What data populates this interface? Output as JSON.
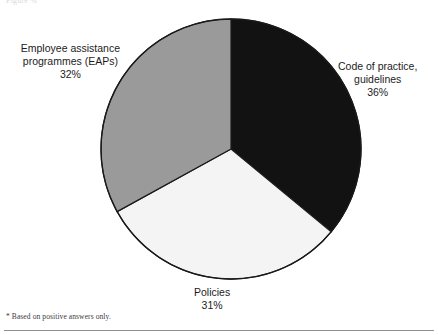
{
  "figure": {
    "caption_remnant": "Figure                                                 %",
    "footnote": "* Based on positive answers only."
  },
  "chart_data": {
    "type": "pie",
    "title": "",
    "subtitle": "",
    "xlabel": "",
    "ylabel": "",
    "legend_position": "none",
    "grid": false,
    "start_angle_deg": 0,
    "direction": "clockwise",
    "units": "%",
    "categories": [
      "Code of practice, guidelines",
      "Policies",
      "Employee assistance programmes (EAPs)"
    ],
    "values": [
      36,
      31,
      32
    ],
    "total": 99,
    "slices": [
      {
        "id": "code-of-practice",
        "label_lines": [
          "Code of practice,",
          "guidelines"
        ],
        "label_text": "Code of practice, guidelines",
        "value": 36,
        "value_text": "36%",
        "color": "#121212",
        "stroke": "#1a1a1a",
        "start_deg": 0,
        "end_deg": 129.6,
        "label_position": "right"
      },
      {
        "id": "policies",
        "label_lines": [
          "Policies"
        ],
        "label_text": "Policies",
        "value": 31,
        "value_text": "31%",
        "color": "#f4f4f4",
        "stroke": "#1a1a1a",
        "start_deg": 129.6,
        "end_deg": 241.2,
        "label_position": "bottom"
      },
      {
        "id": "eaps",
        "label_lines": [
          "Employee assistance",
          "programmes (EAPs)"
        ],
        "label_text": "Employee assistance programmes (EAPs)",
        "value": 32,
        "value_text": "32%",
        "color": "#9a9a9a",
        "stroke": "#1a1a1a",
        "start_deg": 241.2,
        "end_deg": 360,
        "label_position": "left"
      }
    ],
    "annotations": [
      "* Based on positive answers only."
    ]
  },
  "labels": {
    "eaps": {
      "line1": "Employee assistance",
      "line2": "programmes (EAPs)",
      "value": "32%"
    },
    "code": {
      "line1": "Code of practice,",
      "line2": "guidelines",
      "value": "36%"
    },
    "policies": {
      "line1": "Policies",
      "value": "31%"
    }
  },
  "colors": {
    "slice_black": "#121212",
    "slice_gray": "#9a9a9a",
    "slice_white": "#f4f4f4",
    "outline": "#1a1a1a",
    "text": "#1c1c1c",
    "rule": "#8e8e96",
    "background": "#ffffff"
  }
}
